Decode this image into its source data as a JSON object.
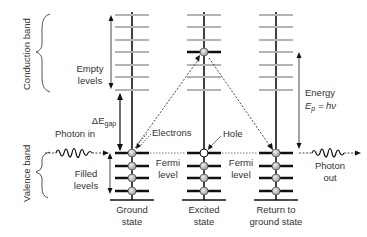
{
  "bands": {
    "conduction": "Conduction band",
    "valence": "Valence band"
  },
  "labels": {
    "empty_levels_1": "Empty",
    "empty_levels_2": "levels",
    "filled_levels_1": "Filled",
    "filled_levels_2": "levels",
    "gap_symbol": "ΔE",
    "gap_subscript": "gap",
    "photon_in": "Photon in",
    "photon_out_1": "Photon",
    "photon_out_2": "out",
    "electrons": "Electrons",
    "hole": "Hole",
    "fermi_1": "Fermi",
    "fermi_2": "level",
    "energy": "Energy",
    "energy_eq_E": "E",
    "energy_eq_sub": "p",
    "energy_eq_rest": " = hν"
  },
  "states": [
    {
      "line1": "Ground",
      "line2": "state"
    },
    {
      "line1": "Excited",
      "line2": "state"
    },
    {
      "line1": "Return to",
      "line2": "ground state"
    }
  ],
  "colors": {
    "empty_level": "#b3b3b3",
    "filled_level": "#111111",
    "electron_fill": "#c8c8c8",
    "text": "#333333"
  }
}
